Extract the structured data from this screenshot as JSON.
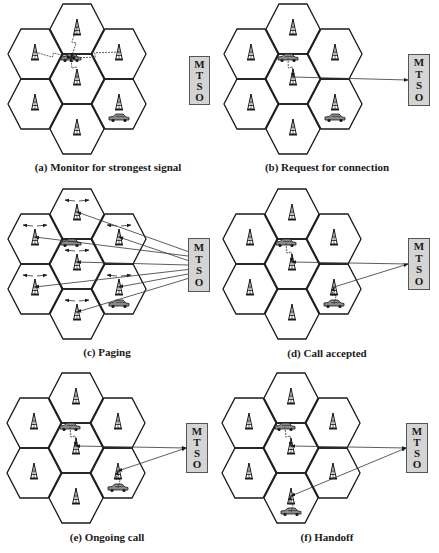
{
  "figure": {
    "width": 439,
    "height": 553,
    "colors": {
      "hex_stroke": "#1a1a1a",
      "mtso_fill": "#d4d4d4",
      "mtso_border": "#555555",
      "link": "#333333",
      "text": "#1a1a1a"
    },
    "hex": {
      "half_width": 27,
      "half_height": 25,
      "top_half": 14,
      "col_dx": 42
    },
    "mtso_label": [
      "M",
      "T",
      "S",
      "O"
    ]
  },
  "panels": [
    {
      "id": "a",
      "caption": "(a) Monitor for strongest signal",
      "origin": {
        "cx": 77,
        "top": 4
      },
      "caption_pos": {
        "x": 108,
        "y": 161
      },
      "mtso_box": {
        "x": 189,
        "y": 56,
        "w": 21,
        "h": 49
      },
      "car_cells": [
        "center",
        "right_bottom"
      ],
      "car_positions": [
        {
          "cell": "center",
          "dx": -6,
          "dy": -21
        },
        {
          "cell": "right_bottom",
          "dx": 0,
          "dy": 14
        }
      ],
      "arrows": [
        {
          "from": "tower:left_top",
          "to": "car:0",
          "kind": "wireless"
        },
        {
          "from": "tower:top",
          "to": "car:0",
          "kind": "wireless"
        },
        {
          "from": "tower:right_top",
          "to": "car:0",
          "kind": "wireless"
        },
        {
          "from": "tower:center",
          "to": "car:0",
          "kind": "wireless"
        }
      ],
      "broadcast": false
    },
    {
      "id": "b",
      "caption": "(b) Request for connection",
      "origin": {
        "cx": 293,
        "top": 4
      },
      "caption_pos": {
        "x": 327,
        "y": 161
      },
      "mtso_box": {
        "x": 408,
        "y": 54,
        "w": 22,
        "h": 52
      },
      "car_positions": [
        {
          "cell": "center",
          "dx": -5,
          "dy": -21
        },
        {
          "cell": "right_bottom",
          "dx": 0,
          "dy": 14
        }
      ],
      "arrows": [
        {
          "from": "car:0",
          "to": "tower:center",
          "kind": "wireless"
        },
        {
          "from": "tower:center",
          "to": "mtso",
          "kind": "wire"
        }
      ],
      "broadcast": false
    },
    {
      "id": "c",
      "caption": "(c) Paging",
      "origin": {
        "cx": 77,
        "top": 189
      },
      "caption_pos": {
        "x": 107,
        "y": 346
      },
      "mtso_box": {
        "x": 188,
        "y": 238,
        "w": 22,
        "h": 54
      },
      "car_positions": [
        {
          "cell": "center",
          "dx": -6,
          "dy": -21
        },
        {
          "cell": "right_bottom",
          "dx": 0,
          "dy": 15
        }
      ],
      "arrows": [
        {
          "from": "mtso",
          "to": "tower:top",
          "kind": "wire"
        },
        {
          "from": "mtso",
          "to": "tower:left_top",
          "kind": "wire"
        },
        {
          "from": "mtso",
          "to": "tower:right_top",
          "kind": "wire"
        },
        {
          "from": "mtso",
          "to": "tower:center",
          "kind": "wire"
        },
        {
          "from": "mtso",
          "to": "tower:left_bottom",
          "kind": "wire"
        },
        {
          "from": "mtso",
          "to": "tower:right_bottom",
          "kind": "wire"
        },
        {
          "from": "mtso",
          "to": "tower:bottom",
          "kind": "wire"
        }
      ],
      "broadcast": true
    },
    {
      "id": "d",
      "caption": "(d) Call accepted",
      "origin": {
        "cx": 292,
        "top": 189
      },
      "caption_pos": {
        "x": 327,
        "y": 347
      },
      "mtso_box": {
        "x": 408,
        "y": 238,
        "w": 22,
        "h": 52
      },
      "car_positions": [
        {
          "cell": "center",
          "dx": -6,
          "dy": -21
        },
        {
          "cell": "right_bottom",
          "dx": 0,
          "dy": 15
        }
      ],
      "arrows": [
        {
          "from": "car:0",
          "to": "tower:center",
          "kind": "wireless"
        },
        {
          "from": "mtso",
          "to": "tower:center",
          "kind": "wire"
        },
        {
          "from": "car:1",
          "to": "tower:right_bottom",
          "kind": "wireless"
        },
        {
          "from": "tower:right_bottom",
          "to": "mtso",
          "kind": "wire"
        }
      ],
      "broadcast": false
    },
    {
      "id": "e",
      "caption": "(e) Ongoing call",
      "origin": {
        "cx": 76,
        "top": 373
      },
      "caption_pos": {
        "x": 107,
        "y": 531
      },
      "mtso_box": {
        "x": 186,
        "y": 423,
        "w": 22,
        "h": 50
      },
      "car_positions": [
        {
          "cell": "center",
          "dx": -6,
          "dy": -21
        },
        {
          "cell": "right_bottom",
          "dx": 0,
          "dy": 15
        }
      ],
      "arrows": [
        {
          "from": "car:0",
          "to": "tower:center",
          "kind": "wireless"
        },
        {
          "from": "mtso",
          "to": "tower:center",
          "kind": "wire2"
        },
        {
          "from": "car:1",
          "to": "tower:right_bottom",
          "kind": "wireless"
        },
        {
          "from": "mtso",
          "to": "tower:right_bottom",
          "kind": "wire2"
        }
      ],
      "broadcast": false
    },
    {
      "id": "f",
      "caption": "(f) Handoff",
      "origin": {
        "cx": 291,
        "top": 373
      },
      "caption_pos": {
        "x": 327,
        "y": 531
      },
      "mtso_box": {
        "x": 406,
        "y": 423,
        "w": 22,
        "h": 50
      },
      "car_positions": [
        {
          "cell": "center",
          "dx": -6,
          "dy": -21
        },
        {
          "cell": "bottom",
          "dx": 0,
          "dy": 14
        }
      ],
      "arrows": [
        {
          "from": "car:0",
          "to": "tower:center",
          "kind": "wireless"
        },
        {
          "from": "mtso",
          "to": "tower:center",
          "kind": "wire2"
        },
        {
          "from": "car:1",
          "to": "tower:bottom",
          "kind": "wireless"
        },
        {
          "from": "mtso",
          "to": "tower:bottom",
          "kind": "wire2"
        }
      ],
      "broadcast": false
    }
  ]
}
